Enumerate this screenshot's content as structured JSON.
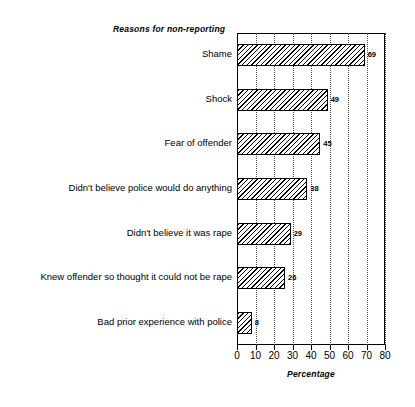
{
  "chart_data": {
    "type": "bar",
    "orientation": "horizontal",
    "title": "Reasons  for non-reporting",
    "xlabel": "Percentage",
    "ylabel": "",
    "xlim": [
      0,
      80
    ],
    "xticks": [
      0,
      10,
      20,
      30,
      40,
      50,
      60,
      70,
      80
    ],
    "xtick_labels": [
      "0",
      "10",
      "20",
      "30",
      "40",
      "50",
      "60",
      "70",
      "80"
    ],
    "grid": "vertical-dotted",
    "legend": "none",
    "categories": [
      "Shame",
      "Shock",
      "Fear of offender",
      "Didn't believe police would do anything",
      "Didn't believe it was rape",
      "Knew offender so thought it could not be rape",
      "Bad prior experience with police"
    ],
    "values": [
      69,
      49,
      45,
      38,
      29,
      26,
      8
    ],
    "value_labels": [
      "69",
      "49",
      "45",
      "38",
      "29",
      "26",
      "8"
    ],
    "bar_style": {
      "fill": "diagonal-hatch",
      "edge_color": "#000000",
      "face_color": "#ffffff"
    }
  },
  "colors": {
    "background": "#ffffff",
    "ink": "#000000",
    "gridline": "#4a4a4a"
  }
}
